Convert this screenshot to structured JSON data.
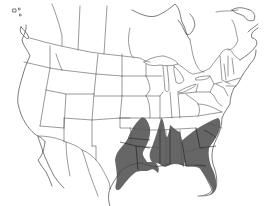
{
  "map": {
    "title": "",
    "region": "North America (United States, southern Canada, northern Mexico)",
    "projection": "conic",
    "background_color": "#ffffff",
    "line_color": "#555555",
    "range_fill_color": "#666666",
    "shaded_range": {
      "label": "",
      "states": [
        "Texas (east)",
        "Oklahoma (east)",
        "Arkansas",
        "Louisiana",
        "Mississippi",
        "Alabama",
        "Georgia",
        "Florida",
        "South Carolina",
        "North Carolina (east)",
        "Tennessee (west)",
        "Missouri (south)"
      ]
    },
    "legend": [],
    "labels": []
  }
}
